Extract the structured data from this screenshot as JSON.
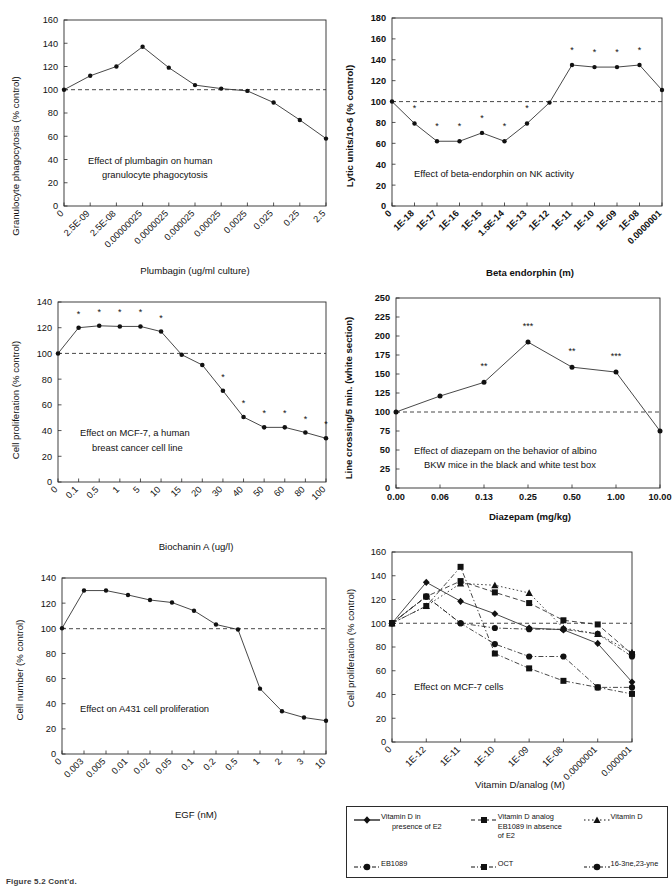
{
  "figure": {
    "caption": "Figure 5.2 Cont'd.",
    "panel_count": 6
  },
  "legend": {
    "entries": [
      {
        "label": "Vitamin D in presence of E2",
        "label_line1": "Vitamin D in",
        "label_line2": "presence of E2",
        "marker": "diamond",
        "line": "solid"
      },
      {
        "label": "Vitamin D analog EB1089 in absence of E2",
        "label_line1": "Vitamin D analog",
        "label_line2": "EB1089 in absence",
        "label_line3": "of E2",
        "marker": "square",
        "line": "dashed"
      },
      {
        "label": "Vitamin D",
        "label_line1": "Vitamin D",
        "marker": "triangle",
        "line": "dotted"
      },
      {
        "label": "EB1089",
        "label_line1": "EB1089",
        "marker": "circle",
        "line": "dashdot"
      },
      {
        "label": "OCT",
        "label_line1": "OCT",
        "marker": "square",
        "line": "dashdot"
      },
      {
        "label": "16-3ne,23-yne",
        "label_line1": "16-3ne,23-yne",
        "marker": "circle",
        "line": "dashdot"
      }
    ]
  },
  "chart_data": [
    {
      "id": "plumbagin-granulocyte-phagocytosis",
      "type": "line",
      "title": "",
      "annotation": "Effect of plumbagin on human granulocyte phagocytosis",
      "annotation_line1": "Effect of plumbagin on human",
      "annotation_line2": "granulocyte phagocytosis",
      "xlabel": "Plumbagin (ug/ml culture)",
      "ylabel": "Granulocyte phagocytosis (% control)",
      "categories": [
        "0",
        "2.5E-09",
        "2.5E-08",
        "0.00000025",
        "0.0000025",
        "0.000025",
        "0.00025",
        "0.0025",
        "0.025",
        "0.25",
        "2.5"
      ],
      "values": [
        100,
        112,
        120,
        137,
        119,
        104,
        101,
        99,
        89,
        74,
        58
      ],
      "ylim": [
        0,
        160
      ],
      "yticks": [
        0,
        20,
        40,
        60,
        80,
        100,
        120,
        140,
        160
      ],
      "reference_line": 100,
      "grid": false,
      "significance": [
        "",
        "",
        "",
        "",
        "",
        "",
        "",
        "",
        "",
        "",
        ""
      ]
    },
    {
      "id": "beta-endorphin-nk-activity",
      "type": "line",
      "title": "",
      "annotation": "Effect of beta-endorphin on NK activity",
      "annotation_line1": "Effect of beta-endorphin on NK activity",
      "xlabel": "Beta endorphin (m)",
      "ylabel": "Lytic units/10-6 (% control)",
      "categories": [
        "0",
        "1E-18",
        "1E-17",
        "1E-16",
        "1E-15",
        "1.5E-14",
        "1E-13",
        "1E-12",
        "1E-11",
        "1E-10",
        "1E-09",
        "1E-08",
        "0.0000001"
      ],
      "values": [
        100,
        79,
        62,
        62,
        70,
        62,
        79,
        99,
        135,
        133,
        133,
        135,
        111
      ],
      "ylim": [
        0,
        180
      ],
      "yticks": [
        0,
        20,
        40,
        60,
        80,
        100,
        120,
        140,
        160,
        180
      ],
      "reference_line": 100,
      "grid": false,
      "significance": [
        "",
        "*",
        "*",
        "*",
        "*",
        "*",
        "*",
        "",
        "*",
        "*",
        "*",
        "*",
        ""
      ]
    },
    {
      "id": "biochanin-a-mcf7-proliferation",
      "type": "line",
      "title": "",
      "annotation": "Effect on MCF-7, a human breast cancer cell line",
      "annotation_line1": "Effect on MCF-7, a human",
      "annotation_line2": "breast cancer cell line",
      "xlabel": "Biochanin A (ug/l)",
      "ylabel": "Cell proliferation (% control)",
      "categories": [
        "0",
        "0.1",
        "0.5",
        "1",
        "5",
        "10",
        "15",
        "20",
        "30",
        "40",
        "50",
        "60",
        "80",
        "100"
      ],
      "values": [
        100,
        120,
        121.5,
        121,
        121,
        117,
        99,
        91,
        71,
        50.5,
        42.5,
        42.5,
        38.5,
        34
      ],
      "ylim": [
        0,
        140
      ],
      "yticks": [
        0,
        20,
        40,
        60,
        80,
        100,
        120,
        140
      ],
      "reference_line": 100,
      "grid": false,
      "significance": [
        "",
        "*",
        "*",
        "*",
        "*",
        "*",
        "",
        "",
        "*",
        "*",
        "*",
        "*",
        "*",
        "*"
      ]
    },
    {
      "id": "diazepam-line-crossing",
      "type": "line",
      "title": "",
      "annotation": "Effect of diazepam on the behavior of albino BKW mice in the black and white test box",
      "annotation_line1": "Effect of diazepam on the behavior of albino",
      "annotation_line2": "BKW mice in the black and white test box",
      "xlabel": "Diazepam (mg/kg)",
      "ylabel": "Line crossing/5 min. (white section)",
      "categories": [
        "0.00",
        "0.06",
        "0.13",
        "0.25",
        "0.50",
        "1.00",
        "10.00"
      ],
      "values": [
        100,
        121,
        139,
        192,
        159,
        152.5,
        75
      ],
      "ylim": [
        0,
        250
      ],
      "yticks": [
        0,
        25,
        50,
        75,
        100,
        125,
        150,
        175,
        200,
        225,
        250
      ],
      "reference_line": 100,
      "grid": false,
      "significance": [
        "",
        "",
        "**",
        "***",
        "**",
        "***",
        ""
      ]
    },
    {
      "id": "egf-a431-proliferation",
      "type": "line",
      "title": "",
      "annotation": "Effect on A431 cell proliferation",
      "annotation_line1": "Effect on A431 cell proliferation",
      "xlabel": "EGF (nM)",
      "ylabel": "Cell number (% control)",
      "categories": [
        "0",
        "0.003",
        "0.005",
        "0.01",
        "0.02",
        "0.05",
        "0.1",
        "0.2",
        "0.5",
        "1",
        "2",
        "3",
        "10"
      ],
      "values": [
        100,
        130,
        130,
        126.5,
        122.5,
        120.5,
        114,
        103,
        99,
        52,
        34,
        29,
        26.5
      ],
      "ylim": [
        0,
        140
      ],
      "yticks": [
        0,
        20,
        40,
        60,
        80,
        100,
        120,
        140
      ],
      "reference_line": 100,
      "grid": false,
      "significance": [
        "",
        "",
        "",
        "",
        "",
        "",
        "",
        "",
        "",
        "",
        "",
        "",
        ""
      ]
    },
    {
      "id": "vitamin-d-analogs-mcf7",
      "type": "line",
      "title": "",
      "annotation": "Effect on MCF-7 cells",
      "annotation_line1": "Effect on MCF-7 cells",
      "xlabel": "Vitamin D/analog (M)",
      "ylabel": "Cell proliferation (% control)",
      "categories": [
        "0",
        "1E-12",
        "1E-11",
        "1E-10",
        "1E-09",
        "1E-08",
        "0.0000001",
        "0.000001"
      ],
      "ylim": [
        0,
        160
      ],
      "yticks": [
        0,
        20,
        40,
        60,
        80,
        100,
        120,
        140,
        160
      ],
      "reference_line": 100,
      "grid": false,
      "series": [
        {
          "name": "Vitamin D in presence of E2",
          "marker": "diamond",
          "line": "solid",
          "values": [
            100,
            134.5,
            118.5,
            108,
            96,
            94.5,
            83,
            50.5
          ]
        },
        {
          "name": "Vitamin D analog EB1089 in absence of E2",
          "marker": "square",
          "line": "dashed",
          "values": [
            100,
            122.5,
            135.5,
            126,
            117,
            102.5,
            99,
            74
          ]
        },
        {
          "name": "Vitamin D",
          "marker": "triangle",
          "line": "dotted",
          "values": [
            100,
            114.5,
            133.5,
            132,
            125.5,
            96,
            91,
            75.5
          ]
        },
        {
          "name": "EB1089",
          "marker": "circle",
          "line": "dashdot",
          "values": [
            100,
            122.5,
            100,
            82.5,
            72,
            72,
            46,
            46
          ]
        },
        {
          "name": "OCT",
          "marker": "square",
          "line": "dashdot",
          "values": [
            100,
            114.5,
            147.5,
            74.5,
            62,
            51.5,
            46,
            40.5
          ]
        },
        {
          "name": "16-3ne,23-yne",
          "marker": "circle",
          "line": "dashdot",
          "values": [
            100,
            122.5,
            100,
            96,
            95,
            95,
            91,
            72
          ]
        }
      ]
    }
  ]
}
